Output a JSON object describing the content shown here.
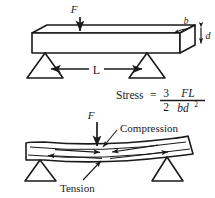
{
  "figure": {
    "background_color": "#ffffff",
    "line_color": "#1a1a1a",
    "fill_color": "#ffffff"
  },
  "top_diagram": {
    "force_label": "F",
    "width_label": "b",
    "depth_label": "d",
    "span_label": "L",
    "description": "Three-point bend test: rectangular bar resting on two triangular supports with central downward force F, span L, breadth b, depth d"
  },
  "formula": {
    "name": "Stress",
    "equals": "=",
    "coefficient_numerator": "3",
    "coefficient_denominator": "2",
    "fraction_numerator": "FL",
    "fraction_denominator_base": "bd",
    "fraction_denominator_exponent": "2",
    "full_text": "Stress = 3/2 · FL/bd²"
  },
  "bottom_diagram": {
    "force_label": "F",
    "compression_label": "Compression",
    "tension_label": "Tension",
    "description": "Deflected beam under central load showing inward compression arrows on upper surface and outward tension arrows on lower surface"
  }
}
